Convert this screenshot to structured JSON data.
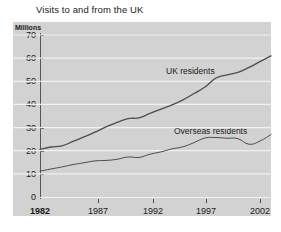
{
  "chart_data": {
    "type": "line",
    "title": "Visits to and from the UK",
    "xlabel": "",
    "ylabel": "Millions",
    "unit_label": "Millions",
    "xlim": [
      1982,
      2003
    ],
    "ylim": [
      0,
      70
    ],
    "yticks": [
      0,
      10,
      20,
      30,
      40,
      50,
      60,
      70
    ],
    "ytick_labels": [
      "0",
      "10",
      "20",
      "30",
      "40",
      "50",
      "60",
      "70"
    ],
    "xticks": [
      1982,
      1987,
      1992,
      1997,
      2002
    ],
    "xtick_labels": [
      "1982",
      "1987",
      "1992",
      "1997",
      "2002"
    ],
    "grid": true,
    "grid_axis": "y",
    "legend_position": "inline-annotation",
    "x": [
      1982,
      1983,
      1984,
      1985,
      1986,
      1987,
      1988,
      1989,
      1990,
      1991,
      1992,
      1993,
      1994,
      1995,
      1996,
      1997,
      1998,
      1999,
      2000,
      2001,
      2002,
      2003
    ],
    "series": [
      {
        "name": "UK residents",
        "color": "#4d4d4d",
        "values": [
          20.6,
          21.6,
          22.1,
          24.0,
          26.0,
          28.0,
          30.3,
          32.2,
          33.9,
          34.2,
          36.1,
          38.0,
          39.8,
          42.0,
          44.7,
          47.5,
          51.4,
          52.8,
          53.9,
          56.0,
          58.5,
          61.0
        ]
      },
      {
        "name": "Overseas residents",
        "color": "#4d4d4d",
        "values": [
          11.2,
          12.1,
          13.0,
          14.0,
          14.8,
          15.6,
          15.8,
          16.3,
          17.3,
          17.1,
          18.5,
          19.5,
          20.8,
          21.7,
          23.5,
          25.5,
          25.7,
          25.4,
          25.2,
          22.8,
          24.2,
          27.0
        ]
      }
    ],
    "annotations": [
      {
        "text": "UK residents",
        "x_px": 166,
        "y_px": 66
      },
      {
        "text": "Overseas residents",
        "x_px": 174,
        "y_px": 126
      }
    ]
  }
}
